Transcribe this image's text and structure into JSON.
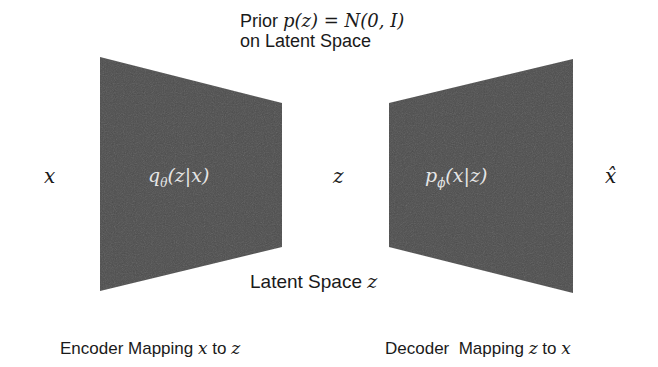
{
  "prior_label": {
    "text_prefix": "Prior ",
    "formula": "p(z) = N(0, I)",
    "line2": "on Latent Space"
  },
  "input_symbol": "x",
  "latent_symbol": "z",
  "output_symbol": "x̂",
  "encoder": {
    "formula_q": "q",
    "formula_sub": "θ",
    "formula_rest": "(z|x)",
    "caption_prefix": "Encoder Mapping ",
    "caption_var1": "x",
    "caption_mid": " to ",
    "caption_var2": "z"
  },
  "decoder": {
    "formula_p": "p",
    "formula_sub": "ϕ",
    "formula_rest": "(x|z)",
    "caption_prefix": "Decoder  Mapping ",
    "caption_var1": "z",
    "caption_mid": " to ",
    "caption_var2": "x"
  },
  "latent_space_label": {
    "prefix": "Latent Space ",
    "var": "z"
  },
  "colors": {
    "block_fill": "#4d4d4d"
  }
}
